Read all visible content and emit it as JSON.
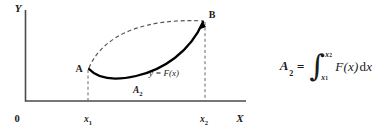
{
  "figure": {
    "axes": {
      "y_axis_label": "Y",
      "x_axis_label": "X",
      "origin_label": "0"
    },
    "ticks": [
      {
        "label_base": "x",
        "label_sub": "1",
        "name": "x1"
      },
      {
        "label_base": "x",
        "label_sub": "2",
        "name": "x2"
      }
    ],
    "points": [
      {
        "label": "A",
        "name": "point-a"
      },
      {
        "label": "B",
        "name": "point-b"
      }
    ],
    "curve_label": "y = F(x)",
    "area_label_base": "A",
    "area_label_sub": "2",
    "colors": {
      "ink": "#1a1a1a",
      "axis": "#4a4a4a",
      "curve_solid": "#000000",
      "curve_dashed": "#555555",
      "background": "#ffffff"
    }
  },
  "formula": {
    "lhs_var": "A",
    "lhs_sub": "2",
    "equals": "=",
    "integral_sign": "∫",
    "upper_limit_base": "x",
    "upper_limit_sub": "2",
    "lower_limit_base": "x",
    "lower_limit_sub": "1",
    "integrand": "F",
    "paren_open": "(",
    "integrand_var": "x",
    "paren_close": ")",
    "differential_d": "d",
    "differential_var": "x",
    "plain_text": "A_2 = ∫_{x_1}^{x_2} F(x)dx"
  }
}
